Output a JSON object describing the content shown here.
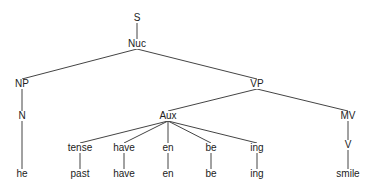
{
  "diagram": {
    "type": "syntax-tree",
    "nodes": [
      {
        "id": "S",
        "label": "S",
        "x": 137,
        "y": 18
      },
      {
        "id": "Nuc",
        "label": "Nuc",
        "x": 137,
        "y": 44
      },
      {
        "id": "NP",
        "label": "NP",
        "x": 22,
        "y": 84
      },
      {
        "id": "N",
        "label": "N",
        "x": 22,
        "y": 116
      },
      {
        "id": "he",
        "label": "he",
        "x": 22,
        "y": 174
      },
      {
        "id": "VP",
        "label": "VP",
        "x": 257,
        "y": 84
      },
      {
        "id": "Aux",
        "label": "Aux",
        "x": 168,
        "y": 116
      },
      {
        "id": "tense",
        "label": "tense",
        "x": 80,
        "y": 148
      },
      {
        "id": "past",
        "label": "past",
        "x": 80,
        "y": 174
      },
      {
        "id": "have1",
        "label": "have",
        "x": 124,
        "y": 148
      },
      {
        "id": "have2",
        "label": "have",
        "x": 124,
        "y": 174
      },
      {
        "id": "en1",
        "label": "en",
        "x": 168,
        "y": 148
      },
      {
        "id": "en2",
        "label": "en",
        "x": 168,
        "y": 174
      },
      {
        "id": "be1",
        "label": "be",
        "x": 211,
        "y": 148
      },
      {
        "id": "be2",
        "label": "be",
        "x": 211,
        "y": 174
      },
      {
        "id": "ing1",
        "label": "ing",
        "x": 257,
        "y": 148
      },
      {
        "id": "ing2",
        "label": "ing",
        "x": 257,
        "y": 174
      },
      {
        "id": "MV",
        "label": "MV",
        "x": 348,
        "y": 116
      },
      {
        "id": "V",
        "label": "V",
        "x": 348,
        "y": 145
      },
      {
        "id": "smile",
        "label": "smile",
        "x": 348,
        "y": 174
      }
    ],
    "edges": [
      [
        "S",
        "Nuc"
      ],
      [
        "Nuc",
        "NP"
      ],
      [
        "Nuc",
        "VP"
      ],
      [
        "NP",
        "N"
      ],
      [
        "N",
        "he"
      ],
      [
        "VP",
        "Aux"
      ],
      [
        "VP",
        "MV"
      ],
      [
        "Aux",
        "tense"
      ],
      [
        "Aux",
        "have1"
      ],
      [
        "Aux",
        "en1"
      ],
      [
        "Aux",
        "be1"
      ],
      [
        "Aux",
        "ing1"
      ],
      [
        "tense",
        "past"
      ],
      [
        "have1",
        "have2"
      ],
      [
        "en1",
        "en2"
      ],
      [
        "be1",
        "be2"
      ],
      [
        "ing1",
        "ing2"
      ],
      [
        "MV",
        "V"
      ],
      [
        "V",
        "smile"
      ]
    ]
  }
}
